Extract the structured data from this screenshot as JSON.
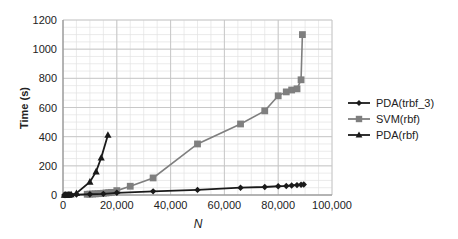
{
  "chart_data": {
    "type": "line",
    "title": "",
    "xlabel": "N",
    "ylabel": "Time (s)",
    "xlim": [
      0,
      100000
    ],
    "ylim": [
      0,
      1200
    ],
    "xticks": [
      0,
      20000,
      40000,
      60000,
      80000,
      100000
    ],
    "xtick_labels": [
      "0",
      "20,000",
      "40,000",
      "60,000",
      "80,000",
      "100,000"
    ],
    "yticks": [
      0,
      200,
      400,
      600,
      800,
      1000,
      1200
    ],
    "ytick_labels": [
      "0",
      "200",
      "400",
      "600",
      "800",
      "1000",
      "1200"
    ],
    "grid": true,
    "legend_position": "right",
    "series": [
      {
        "name": "PDA(trbf_3)",
        "marker": "diamond",
        "color": "#1a1a1a",
        "x": [
          500,
          1000,
          1500,
          2000,
          2500,
          3000,
          5000,
          10000,
          15000,
          20000,
          33500,
          50000,
          66000,
          75000,
          80000,
          83000,
          85000,
          87000,
          88500,
          89500
        ],
        "y": [
          0,
          0,
          1,
          1,
          1,
          2,
          3,
          5,
          8,
          15,
          25,
          35,
          50,
          55,
          60,
          62,
          65,
          68,
          70,
          72
        ]
      },
      {
        "name": "SVM(rbf)",
        "marker": "square",
        "color": "#7f7f7f",
        "x": [
          9000,
          10000,
          11000,
          12000,
          13000,
          14000,
          15000,
          16000,
          17000,
          18000,
          20000,
          25000,
          33500,
          50000,
          66000,
          75000,
          80000,
          83000,
          85000,
          87000,
          88500,
          89000
        ],
        "y": [
          5,
          6,
          7,
          8,
          9,
          10,
          12,
          14,
          16,
          18,
          30,
          60,
          117,
          350,
          487,
          577,
          680,
          707,
          720,
          728,
          790,
          1100
        ]
      },
      {
        "name": "PDA(rbf)",
        "marker": "triangle",
        "color": "#1a1a1a",
        "x": [
          500,
          1000,
          1500,
          2000,
          2500,
          3000,
          5000,
          10000,
          12300,
          14200,
          16700
        ],
        "y": [
          0,
          1,
          1,
          2,
          2,
          3,
          12,
          90,
          160,
          255,
          411
        ]
      }
    ]
  }
}
